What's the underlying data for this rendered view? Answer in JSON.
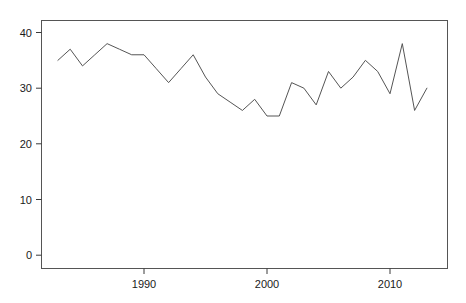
{
  "chart_data": {
    "type": "line",
    "title": "",
    "subtitle": "",
    "xlabel": "",
    "ylabel": "",
    "xlim": [
      1982.2,
      2014.7
    ],
    "ylim": [
      -1.5,
      42.0
    ],
    "grid": false,
    "legend": null,
    "annotations": [],
    "xticks": [
      1990,
      2000,
      2010
    ],
    "xticklabels": [
      "1990",
      "2000",
      "2010"
    ],
    "yticks": [
      0,
      10,
      20,
      30,
      40
    ],
    "yticklabels": [
      "0",
      "10",
      "20",
      "30",
      "40"
    ],
    "line_color": "#555555",
    "line_width": 1.0,
    "x": [
      1983,
      1984,
      1985,
      1986,
      1987,
      1988,
      1989,
      1990,
      1991,
      1992,
      1993,
      1994,
      1995,
      1996,
      1997,
      1998,
      1999,
      2000,
      2001,
      2002,
      2003,
      2004,
      2005,
      2006,
      2007,
      2008,
      2009,
      2010,
      2011,
      2012,
      2013
    ],
    "values": [
      35,
      37,
      34,
      36,
      38,
      37,
      36,
      36,
      33.5,
      31,
      33.5,
      36,
      32,
      29,
      27.5,
      26,
      28,
      25,
      25,
      31,
      30,
      27,
      33,
      30,
      32,
      35,
      33,
      29,
      38,
      26,
      30
    ],
    "series": [
      {
        "name": "series-1",
        "values": [
          35,
          37,
          34,
          36,
          38,
          37,
          36,
          36,
          33.5,
          31,
          33.5,
          36,
          32,
          29,
          27.5,
          26,
          28,
          25,
          25,
          31,
          30,
          27,
          33,
          30,
          32,
          35,
          33,
          29,
          38,
          26,
          30
        ]
      }
    ]
  },
  "axes": {
    "y_labels": [
      "40",
      "30",
      "20",
      "10",
      "0"
    ],
    "x_labels": [
      "1990",
      "2000",
      "2010"
    ]
  },
  "colors": {
    "line": "#555555",
    "axis": "#3a3a3a",
    "text": "#1a1a1a",
    "background": "#ffffff"
  }
}
